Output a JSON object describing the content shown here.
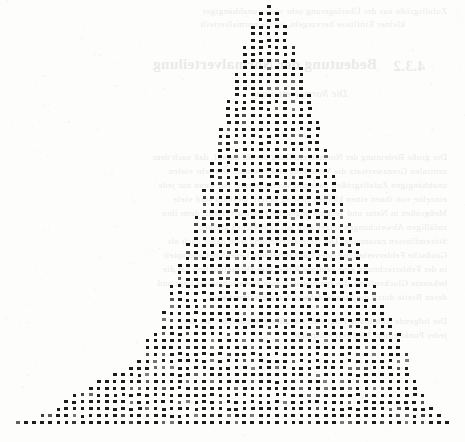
{
  "page": {
    "kind": "scanned-book-page",
    "width": 465,
    "height": 442,
    "paper_color": "#fdfdfc",
    "ink_color": "#1c1c1c"
  },
  "showthrough": {
    "note": "faint mirrored text bleeding through from the reverse side of the sheet",
    "mirrored": true,
    "opacity": 0.085,
    "lines": [
      {
        "text": "Zufallsgröße aus der Überlagerung sehr vieler unabhängiger",
        "x": 18,
        "y": 6,
        "kind": "body"
      },
      {
        "text": "kleiner Einflüsse hervorgeht, ist sie normalverteilt.",
        "x": 60,
        "y": 19,
        "kind": "body"
      },
      {
        "text": "Bedeutung der Normalverteilung",
        "x": 88,
        "y": 56,
        "kind": "head"
      },
      {
        "text": "4.3.2",
        "x": 40,
        "y": 58,
        "kind": "head"
      },
      {
        "text": "Die Normalverteilung",
        "x": 118,
        "y": 88,
        "kind": "math"
      },
      {
        "text": "Die große Bedeutung der Normalverteilung beruht darauf, daß nach dem",
        "x": 18,
        "y": 152,
        "kind": "body"
      },
      {
        "text": "zentralen Grenzwertsatz die Verteilung einer Summe von sehr vielen",
        "x": 18,
        "y": 166,
        "kind": "body"
      },
      {
        "text": "unabhängigen Zufallsgrößen näherungsweise normal ist, wenn nur jede",
        "x": 18,
        "y": 180,
        "kind": "body"
      },
      {
        "text": "einzelne von ihnen einen kleinen Beitrag liefert. Deshalb sind viele",
        "x": 18,
        "y": 194,
        "kind": "body"
      },
      {
        "text": "Meßgrößen in Natur und Technik angenähert normalverteilt, denn ihre",
        "x": 18,
        "y": 208,
        "kind": "body"
      },
      {
        "text": "zufälligen Abweichungen setzen sich aus zahlreichen kleinen",
        "x": 18,
        "y": 222,
        "kind": "body"
      },
      {
        "text": "Störeinflüssen zusammen. Die Normalverteilung wird daher auch als",
        "x": 18,
        "y": 236,
        "kind": "body"
      },
      {
        "text": "Gaußsche Fehlerverteilung oder Gaußverteilung bezeichnet und spielt",
        "x": 18,
        "y": 250,
        "kind": "body"
      },
      {
        "text": "in der Fehlerrechnung eine zentrale Rolle. Ihre Dichtefunktion hat die",
        "x": 18,
        "y": 264,
        "kind": "body"
      },
      {
        "text": "bekannte Glockenform, die symmetrisch zum Erwartungswert liegt und",
        "x": 18,
        "y": 278,
        "kind": "body"
      },
      {
        "text": "deren Breite durch die Standardabweichung bestimmt wird.",
        "x": 18,
        "y": 292,
        "kind": "body"
      },
      {
        "text": "Die folgende Abbildung zeigt eine simulierte Stichprobe, bei der",
        "x": 18,
        "y": 316,
        "kind": "body"
      },
      {
        "text": "jeder Punkt einem Meßwert entspricht.",
        "x": 18,
        "y": 330,
        "kind": "body"
      }
    ]
  },
  "chart_data": {
    "type": "bar",
    "title": "",
    "subtitle": "",
    "xlabel": "",
    "ylabel": "",
    "render_style": "dot-plot-histogram",
    "marker": {
      "shape": "square",
      "width": 3.6,
      "height": 3.0,
      "color": "#1c1c1c"
    },
    "geometry": {
      "baseline_y": 421,
      "column_pitch": 8.1,
      "row_pitch": 6.82,
      "first_column_x": 16,
      "clipped_at_top": true,
      "top_clip_y": 2
    },
    "grid": false,
    "legend": null,
    "axis_visible": false,
    "categories": [
      1,
      2,
      3,
      4,
      5,
      6,
      7,
      8,
      9,
      10,
      11,
      12,
      13,
      14,
      15,
      16,
      17,
      18,
      19,
      20,
      21,
      22,
      23,
      24,
      25,
      26,
      27,
      28,
      29,
      30,
      31,
      32,
      33,
      34,
      35,
      36,
      37,
      38,
      39,
      40,
      41,
      42,
      43,
      44,
      45,
      46,
      47,
      48,
      49,
      50,
      51,
      52,
      53,
      54
    ],
    "values": [
      1,
      1,
      1,
      2,
      2,
      3,
      4,
      5,
      5,
      6,
      7,
      7,
      8,
      8,
      9,
      10,
      13,
      14,
      17,
      21,
      24,
      27,
      31,
      35,
      39,
      44,
      48,
      52,
      56,
      59,
      61,
      62,
      61,
      59,
      56,
      53,
      49,
      45,
      41,
      37,
      33,
      30,
      27,
      24,
      21,
      18,
      16,
      14,
      11,
      7,
      5,
      3,
      2,
      1
    ],
    "ylim": [
      0,
      62
    ],
    "n_columns": 54,
    "peak_value": 62,
    "peak_column_index": 31
  }
}
